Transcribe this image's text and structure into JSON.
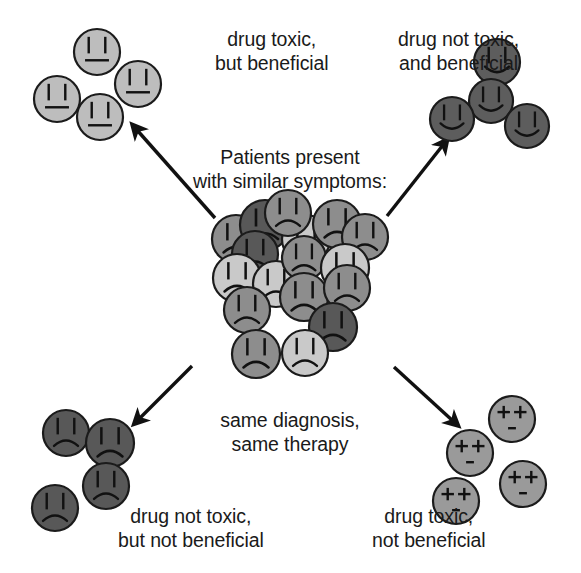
{
  "figure": {
    "type": "concept-diagram",
    "title_center": "Patients present\nwith similar symptoms:",
    "subtitle_center": "same diagnosis,\nsame therapy",
    "background_color": "#ffffff",
    "ink_color": "#1a1a1a"
  },
  "quadrants": [
    {
      "id": "top-left",
      "label": "drug toxic,\nbut beneficial",
      "label_x": 215,
      "label_y": 28,
      "outcome": "toxic-beneficial",
      "face_expression": "neutral",
      "face_count": 4,
      "face_fill": "#bdbdbd",
      "faces": [
        {
          "cx": 97,
          "cy": 52,
          "r": 23
        },
        {
          "cx": 138,
          "cy": 84,
          "r": 23
        },
        {
          "cx": 57,
          "cy": 99,
          "r": 23
        },
        {
          "cx": 100,
          "cy": 117,
          "r": 23
        }
      ]
    },
    {
      "id": "top-right",
      "label": "drug not toxic,\nand beneficial",
      "label_x": 398,
      "label_y": 28,
      "outcome": "nontoxic-beneficial",
      "face_expression": "happy",
      "face_count": 4,
      "face_fill": "#5d5d5d",
      "faces": [
        {
          "cx": 497,
          "cy": 62,
          "r": 23
        },
        {
          "cx": 491,
          "cy": 101,
          "r": 22
        },
        {
          "cx": 452,
          "cy": 119,
          "r": 22
        },
        {
          "cx": 527,
          "cy": 126,
          "r": 22
        }
      ]
    },
    {
      "id": "bottom-left",
      "label": "drug not toxic,\nbut not beneficial",
      "label_x": 118,
      "label_y": 505,
      "outcome": "nontoxic-nonbeneficial",
      "face_expression": "sad",
      "face_count": 4,
      "face_fill": "#585858",
      "faces": [
        {
          "cx": 66,
          "cy": 433,
          "r": 23
        },
        {
          "cx": 110,
          "cy": 443,
          "r": 24
        },
        {
          "cx": 106,
          "cy": 486,
          "r": 23
        },
        {
          "cx": 55,
          "cy": 508,
          "r": 23
        }
      ]
    },
    {
      "id": "bottom-right",
      "label": "drug toxic,\nnot beneficial",
      "label_x": 372,
      "label_y": 505,
      "outcome": "toxic-nonbeneficial",
      "face_expression": "dead",
      "face_count": 4,
      "face_fill": "#9a9a9a",
      "faces": [
        {
          "cx": 512,
          "cy": 419,
          "r": 23
        },
        {
          "cx": 470,
          "cy": 453,
          "r": 23
        },
        {
          "cx": 523,
          "cy": 484,
          "r": 23
        },
        {
          "cx": 456,
          "cy": 501,
          "r": 23
        }
      ]
    }
  ],
  "center_cluster": {
    "face_expression": "sad",
    "face_count": 17,
    "shades": {
      "light": "#c9c9c9",
      "medium": "#8d8d8d",
      "dark": "#585858"
    },
    "faces": [
      {
        "cx": 236,
        "cy": 239,
        "r": 24,
        "shade": "medium"
      },
      {
        "cx": 265,
        "cy": 225,
        "r": 25,
        "shade": "dark"
      },
      {
        "cx": 255,
        "cy": 254,
        "r": 23,
        "shade": "dark"
      },
      {
        "cx": 306,
        "cy": 239,
        "r": 24,
        "shade": "light"
      },
      {
        "cx": 337,
        "cy": 224,
        "r": 24,
        "shade": "medium"
      },
      {
        "cx": 365,
        "cy": 237,
        "r": 23,
        "shade": "medium"
      },
      {
        "cx": 237,
        "cy": 278,
        "r": 24,
        "shade": "light"
      },
      {
        "cx": 276,
        "cy": 284,
        "r": 23,
        "shade": "light"
      },
      {
        "cx": 304,
        "cy": 258,
        "r": 22,
        "shade": "medium"
      },
      {
        "cx": 345,
        "cy": 268,
        "r": 24,
        "shade": "light"
      },
      {
        "cx": 304,
        "cy": 297,
        "r": 24,
        "shade": "medium"
      },
      {
        "cx": 347,
        "cy": 288,
        "r": 23,
        "shade": "medium"
      },
      {
        "cx": 247,
        "cy": 310,
        "r": 23,
        "shade": "medium"
      },
      {
        "cx": 333,
        "cy": 327,
        "r": 24,
        "shade": "dark"
      },
      {
        "cx": 256,
        "cy": 354,
        "r": 24,
        "shade": "medium"
      },
      {
        "cx": 305,
        "cy": 353,
        "r": 23,
        "shade": "light"
      },
      {
        "cx": 288,
        "cy": 213,
        "r": 23,
        "shade": "medium"
      }
    ]
  },
  "arrows": [
    {
      "id": "arrow-to-top-left",
      "x1": 215,
      "y1": 218,
      "x2": 137,
      "y2": 130
    },
    {
      "id": "arrow-to-top-right",
      "x1": 387,
      "y1": 216,
      "x2": 443,
      "y2": 145
    },
    {
      "id": "arrow-to-bottom-left",
      "x1": 192,
      "y1": 366,
      "x2": 139,
      "y2": 419
    },
    {
      "id": "arrow-to-bottom-right",
      "x1": 394,
      "y1": 367,
      "x2": 453,
      "y2": 421
    }
  ],
  "center_text": {
    "heading_line1": "Patients present",
    "heading_line2": "with similar symptoms:",
    "heading_x": 290,
    "heading_y": 146,
    "footer_line1": "same diagnosis,",
    "footer_line2": "same therapy",
    "footer_x": 290,
    "footer_y": 409
  }
}
